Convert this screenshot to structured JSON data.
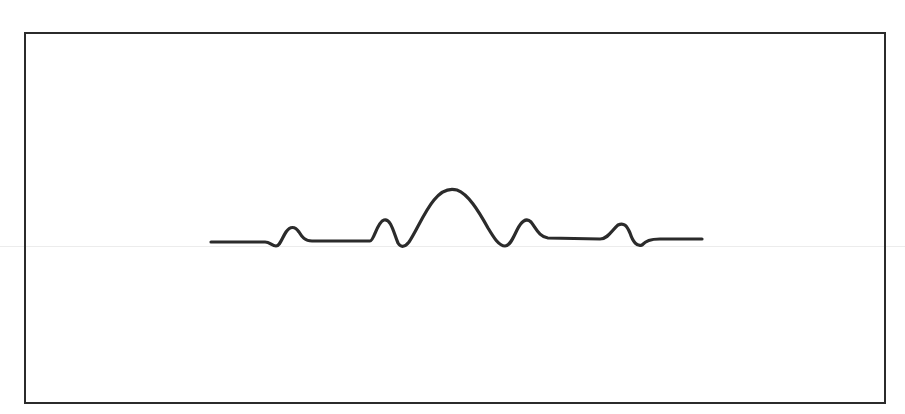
{
  "diagram": {
    "type": "waveform-sketch",
    "colors": {
      "background": "#ffffff",
      "frame": "#2b2b2b",
      "line": "#2b2b2b",
      "scanline": "#ececec"
    },
    "frame": {
      "x": 24,
      "y": 32,
      "width": 860,
      "height": 370
    },
    "waveform": {
      "baseline_y": 241,
      "x_start": 211,
      "x_end": 702,
      "peaks": [
        {
          "label": "side-peak-1",
          "x": 292,
          "y": 227
        },
        {
          "label": "side-peak-2",
          "x": 385,
          "y": 220
        },
        {
          "label": "main-peak",
          "x": 455,
          "y": 190
        },
        {
          "label": "side-peak-3",
          "x": 527,
          "y": 220
        },
        {
          "label": "side-peak-4",
          "x": 620,
          "y": 224
        }
      ]
    }
  }
}
